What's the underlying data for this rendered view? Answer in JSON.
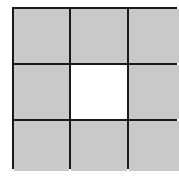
{
  "diagram": {
    "type": "grid",
    "rows": 3,
    "cols": 3,
    "colors": {
      "filled": "#c9c9c9",
      "empty": "#ffffff",
      "border": "#1a1a1a"
    },
    "cells": [
      [
        "filled",
        "filled",
        "filled"
      ],
      [
        "filled",
        "empty",
        "filled"
      ],
      [
        "filled",
        "filled",
        "filled"
      ]
    ]
  }
}
